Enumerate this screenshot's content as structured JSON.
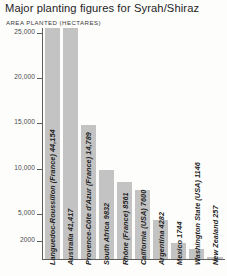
{
  "header": {
    "title": "Major planting figures for Syrah/Shiraz",
    "subtitle": "AREA PLANTED (HECTARES)"
  },
  "chart_data": {
    "type": "bar",
    "title": "Major planting figures for Syrah/Shiraz",
    "subtitle": "AREA PLANTED (HECTARES)",
    "xlabel": "",
    "ylabel": "AREA PLANTED (HECTARES)",
    "ylim": [
      0,
      25000
    ],
    "grid": false,
    "legend": null,
    "orientation": "vertical",
    "bar_color": "#c3c3c3",
    "axis_color": "#5e5e5e",
    "note": "First two bars exceed the 25,000 axis maximum and are drawn clipped at the top of the plot area.",
    "ytick_labels": [
      "25,000",
      "20,000",
      "15,000",
      "10,000",
      "5,000",
      "2000"
    ],
    "ytick_values": [
      25000,
      20000,
      15000,
      10000,
      5000,
      2000
    ],
    "categories": [
      "Languedoc-Roussillon (France)",
      "Australia",
      "Provence-Côte d'Azur (France)",
      "South Africa",
      "Rhône (France)",
      "California (USA)",
      "Argentina",
      "Mexico",
      "Washington State (USA)",
      "New Zealand"
    ],
    "values": [
      44154,
      41417,
      14789,
      9832,
      8561,
      7600,
      4282,
      1744,
      1146,
      257
    ],
    "value_labels": [
      "44,154",
      "41,417",
      "14,789",
      "9832",
      "8561",
      "7600",
      "4282",
      "1744",
      "1146",
      "257"
    ],
    "bar_labels": [
      "Languedoc-Roussillon (France) 44,154",
      "Australia 41,417",
      "Provence-Côte d'Azur (France) 14,789",
      "South Africa 9832",
      "Rhône (France) 8561",
      "California (USA) 7600",
      "Argentina 4282",
      "Mexico 1744",
      "Washington State (USA) 1146",
      "New Zealand 257"
    ]
  }
}
